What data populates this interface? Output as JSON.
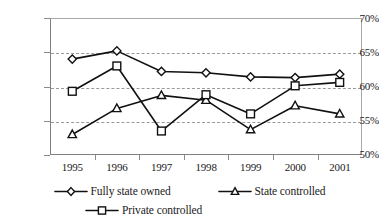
{
  "chart_data": {
    "type": "line",
    "title": "",
    "subtitle": "",
    "xlabel": "",
    "ylabel": "",
    "categories": [
      "1995",
      "1996",
      "1997",
      "1998",
      "1999",
      "2000",
      "2001"
    ],
    "x_tick_labels": [
      "1995",
      "1996",
      "1997",
      "1998",
      "1999",
      "2000",
      "2001"
    ],
    "y_tick_labels": [
      "50%",
      "55%",
      "60%",
      "65%",
      "70%"
    ],
    "y_tick_values": [
      50,
      55,
      60,
      65,
      70
    ],
    "ylim": [
      50,
      70
    ],
    "grid": "horizontal-dashed",
    "legend_position": "bottom",
    "series": [
      {
        "name": "Fully state owned",
        "marker": "diamond",
        "values": [
          64.0,
          65.2,
          62.2,
          62.0,
          61.4,
          61.3,
          61.8
        ]
      },
      {
        "name": "State controlled",
        "marker": "triangle",
        "values": [
          53.0,
          56.8,
          58.7,
          58.0,
          53.7,
          57.2,
          56.0
        ]
      },
      {
        "name": "Private controlled",
        "marker": "square",
        "values": [
          59.3,
          63.0,
          53.5,
          58.8,
          56.0,
          60.1,
          60.6
        ]
      }
    ],
    "colors": {
      "line": "#111111",
      "marker_fill": "#ffffff",
      "gridline": "#9a9a9a",
      "axis": "#808080",
      "background": "#ffffff"
    }
  },
  "legend": {
    "rows": [
      [
        {
          "label": "Fully state owned",
          "marker": "diamond"
        },
        {
          "label": "State controlled",
          "marker": "triangle"
        }
      ],
      [
        {
          "label": "Private controlled",
          "marker": "square"
        }
      ]
    ]
  }
}
